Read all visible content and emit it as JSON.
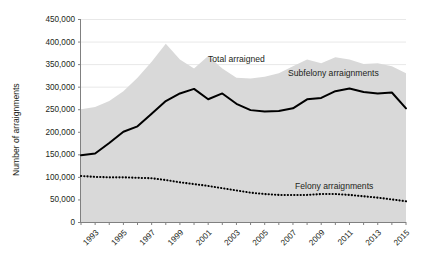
{
  "chart_data": {
    "type": "area",
    "title": "",
    "xlabel": "",
    "ylabel": "Number of arraignments",
    "ylim": [
      0,
      450000
    ],
    "xlim": [
      1992,
      2015
    ],
    "grid": true,
    "legend_position": "inline-annotations",
    "y_ticks": [
      "0",
      "50,000",
      "100,000",
      "150,000",
      "200,000",
      "250,000",
      "300,000",
      "350,000",
      "400,000",
      "450,000"
    ],
    "y_tick_values": [
      0,
      50000,
      100000,
      150000,
      200000,
      250000,
      300000,
      350000,
      400000,
      450000
    ],
    "x_ticks": [
      "1993",
      "1995",
      "1997",
      "1999",
      "2001",
      "2003",
      "2005",
      "2007",
      "2009",
      "2011",
      "2013",
      "2015"
    ],
    "x": [
      1992,
      1993,
      1994,
      1995,
      1996,
      1997,
      1998,
      1999,
      2000,
      2001,
      2002,
      2003,
      2004,
      2005,
      2006,
      2007,
      2008,
      2009,
      2010,
      2011,
      2012,
      2013,
      2014,
      2015
    ],
    "series": [
      {
        "name": "Total arraigned",
        "style": "area",
        "color": "#d9d9d9",
        "values": [
          250000,
          255000,
          268000,
          290000,
          320000,
          355000,
          395000,
          360000,
          340000,
          368000,
          340000,
          320000,
          318000,
          322000,
          330000,
          345000,
          360000,
          352000,
          365000,
          360000,
          350000,
          352000,
          345000,
          330000
        ]
      },
      {
        "name": "Subfelony arraignments",
        "style": "solid-line",
        "color": "#000000",
        "values": [
          148000,
          152000,
          175000,
          200000,
          212000,
          240000,
          268000,
          285000,
          295000,
          272000,
          285000,
          262000,
          248000,
          245000,
          246000,
          252000,
          272000,
          275000,
          290000,
          296000,
          288000,
          285000,
          287000,
          252000
        ]
      },
      {
        "name": "Felony arraignments",
        "style": "dotted-line",
        "color": "#000000",
        "values": [
          102000,
          100000,
          99000,
          99000,
          98000,
          97000,
          93000,
          88000,
          84000,
          80000,
          75000,
          70000,
          65000,
          62000,
          60000,
          60000,
          60000,
          62000,
          62000,
          60000,
          57000,
          54000,
          50000,
          46000
        ]
      }
    ],
    "annotations": [
      {
        "text": "Total arraigned",
        "x_px": 208,
        "y_px": 62
      },
      {
        "text": "Subfelony arraignments",
        "x_px": 288,
        "y_px": 76
      },
      {
        "text": "Felony arraignments",
        "x_px": 295,
        "y_px": 189
      }
    ],
    "axis_title_y": "Number of arraignments"
  },
  "colors": {
    "area_fill": "#d9d9d9",
    "line": "#000000",
    "grid": "#e8e8e8",
    "axis": "#808080",
    "text": "#231f20",
    "background": "#ffffff"
  }
}
